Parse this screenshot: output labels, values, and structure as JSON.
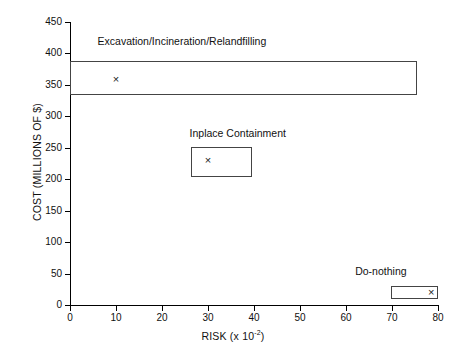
{
  "chart_data": {
    "type": "scatter",
    "title": "",
    "xlabel": "RISK (x 10",
    "xlabel_exponent": "-2",
    "xlabel_close": ")",
    "ylabel": "COST (MILLIONS OF $)",
    "xlim": [
      0,
      80
    ],
    "ylim": [
      0,
      450
    ],
    "xticks": [
      0,
      10,
      20,
      30,
      40,
      50,
      60,
      70,
      80
    ],
    "yticks": [
      0,
      50,
      100,
      150,
      200,
      250,
      300,
      350,
      400,
      450
    ],
    "grid": false,
    "legend": "none",
    "marker_symbol": "×",
    "series": [
      {
        "name": "Excavation/Incineration/Relandfilling",
        "label": "Excavation/Incineration/Relandfilling",
        "point": {
          "x": 10,
          "y": 360
        },
        "box": {
          "x0": 0,
          "x1": 75.5,
          "y0": 334,
          "y1": 388
        },
        "label_pos": {
          "x": 6,
          "y": 418
        }
      },
      {
        "name": "Inplace Containment",
        "label": "Inplace Containment",
        "point": {
          "x": 30,
          "y": 230
        },
        "box": {
          "x0": 26.2,
          "x1": 39.5,
          "y0": 203,
          "y1": 251
        },
        "label_pos": {
          "x": 26,
          "y": 272
        }
      },
      {
        "name": "Do-nothing",
        "label": "Do-nothing",
        "point": {
          "x": 78.5,
          "y": 20
        },
        "box": {
          "x0": 69.8,
          "x1": 80,
          "y0": 9,
          "y1": 31
        },
        "label_pos": {
          "x": 62,
          "y": 52
        }
      }
    ]
  }
}
